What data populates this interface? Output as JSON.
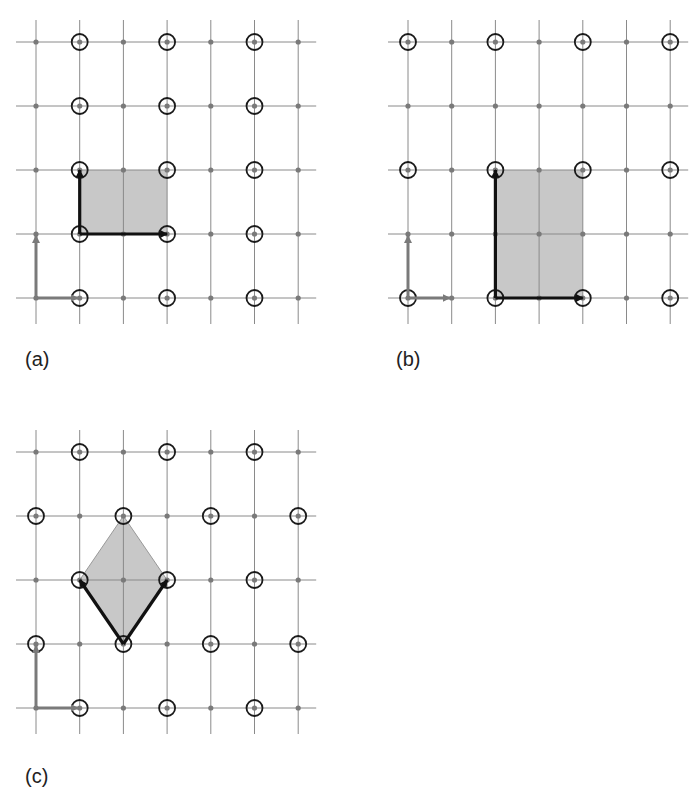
{
  "figure": {
    "panels": [
      {
        "id": "a",
        "label": "(a)",
        "label_pos": [
          25,
          368
        ],
        "origin": [
          36,
          298
        ],
        "lattice_points": [
          [
            1,
            0
          ],
          [
            3,
            0
          ],
          [
            5,
            0
          ],
          [
            1,
            1
          ],
          [
            3,
            1
          ],
          [
            5,
            1
          ],
          [
            1,
            2
          ],
          [
            3,
            2
          ],
          [
            5,
            2
          ],
          [
            1,
            3
          ],
          [
            3,
            3
          ],
          [
            5,
            3
          ],
          [
            1,
            4
          ],
          [
            3,
            4
          ],
          [
            5,
            4
          ]
        ],
        "cell": {
          "type": "rect",
          "from": [
            1,
            1
          ],
          "to": [
            3,
            2
          ]
        },
        "basis_vectors": [
          {
            "from": [
              1,
              1
            ],
            "to": [
              3,
              1
            ]
          },
          {
            "from": [
              1,
              1
            ],
            "to": [
              1,
              2
            ]
          }
        ]
      },
      {
        "id": "b",
        "label": "(b)",
        "label_pos": [
          396,
          368
        ],
        "origin": [
          408,
          298
        ],
        "lattice_points": [
          [
            0,
            0
          ],
          [
            2,
            0
          ],
          [
            4,
            0
          ],
          [
            6,
            0
          ],
          [
            0,
            2
          ],
          [
            2,
            2
          ],
          [
            4,
            2
          ],
          [
            6,
            2
          ],
          [
            0,
            4
          ],
          [
            2,
            4
          ],
          [
            4,
            4
          ],
          [
            6,
            4
          ]
        ],
        "cell": {
          "type": "rect",
          "from": [
            2,
            0
          ],
          "to": [
            4,
            2
          ]
        },
        "basis_vectors": [
          {
            "from": [
              2,
              0
            ],
            "to": [
              4,
              0
            ]
          },
          {
            "from": [
              2,
              0
            ],
            "to": [
              2,
              2
            ]
          }
        ]
      },
      {
        "id": "c",
        "label": "(c)",
        "label_pos": [
          25,
          785
        ],
        "origin": [
          36,
          708
        ],
        "lattice_points": [
          [
            1,
            0
          ],
          [
            3,
            0
          ],
          [
            5,
            0
          ],
          [
            0,
            1
          ],
          [
            2,
            1
          ],
          [
            4,
            1
          ],
          [
            6,
            1
          ],
          [
            1,
            2
          ],
          [
            3,
            2
          ],
          [
            5,
            2
          ],
          [
            0,
            3
          ],
          [
            2,
            3
          ],
          [
            4,
            3
          ],
          [
            6,
            3
          ],
          [
            1,
            4
          ],
          [
            3,
            4
          ],
          [
            5,
            4
          ]
        ],
        "cell": {
          "type": "diamond",
          "points": [
            [
              2,
              1
            ],
            [
              3,
              2
            ],
            [
              2,
              3
            ],
            [
              1,
              2
            ]
          ]
        },
        "basis_vectors": [
          {
            "from": [
              2,
              1
            ],
            "to": [
              1,
              2
            ]
          },
          {
            "from": [
              2,
              1
            ],
            "to": [
              3,
              2
            ]
          }
        ]
      }
    ],
    "grid": {
      "cols": 7,
      "rows": 5,
      "dx": 43.7,
      "dy": 64
    },
    "colors": {
      "grid": "#8a8a8a",
      "dot": "#7a7a7a",
      "circle": "#1a1a1a",
      "cell": "#c8c8c8",
      "basis": "#111111",
      "ref_axes": "#7a7a7a"
    }
  }
}
